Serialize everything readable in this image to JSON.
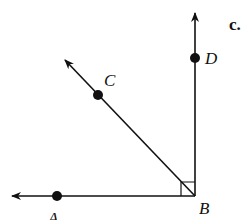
{
  "diagram": {
    "part_label": "c.",
    "vertex": {
      "name": "B",
      "x": 195,
      "y": 196
    },
    "points": [
      {
        "name": "A",
        "x": 57,
        "y": 196,
        "label_x": 48,
        "label_y": 222
      },
      {
        "name": "C",
        "x": 98,
        "y": 95,
        "label_x": 106,
        "label_y": 85
      },
      {
        "name": "D",
        "x": 195,
        "y": 58,
        "label_x": 206,
        "label_y": 64
      }
    ],
    "rays": [
      {
        "name": "BA",
        "from": "B",
        "to_x": 12,
        "to_y": 196
      },
      {
        "name": "BC",
        "from": "B",
        "to_x": 65,
        "to_y": 60
      },
      {
        "name": "BD",
        "from": "B",
        "to_x": 195,
        "to_y": 13
      }
    ],
    "right_angle_mark": {
      "at": "B",
      "between": [
        "BA",
        "BD"
      ],
      "size": 14
    },
    "vertex_label": {
      "text": "B",
      "x": 199,
      "y": 213
    },
    "colors": {
      "stroke": "#111111",
      "background": "#ffffff"
    }
  }
}
